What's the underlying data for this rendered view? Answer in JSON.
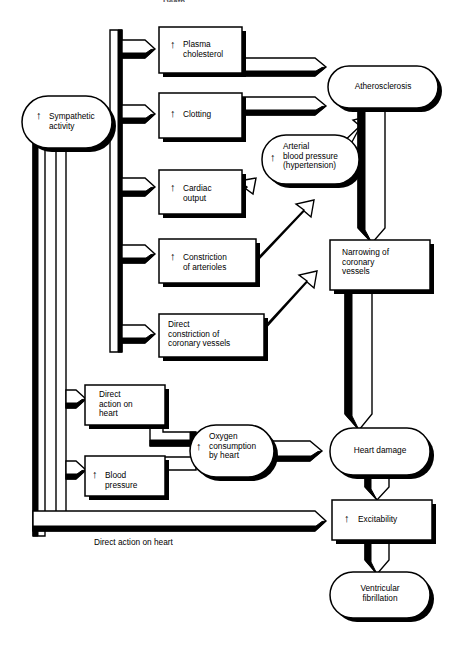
{
  "figure": {
    "title_fragment": "Death",
    "bottom_caption": "Direct action on heart",
    "background_color": "#ffffff",
    "line_color": "#000000"
  },
  "nodes": {
    "sympathetic_activity": {
      "label": "Sympathetic\nactivity",
      "shape": "rounded-oval",
      "has_up_arrow": true
    },
    "plasma_cholesterol": {
      "label": "Plasma\ncholesterol",
      "shape": "rectangle",
      "has_up_arrow": true
    },
    "clotting": {
      "label": "Clotting",
      "shape": "rectangle",
      "has_up_arrow": true
    },
    "cardiac_output": {
      "label": "Cardiac\noutput",
      "shape": "rectangle",
      "has_up_arrow": true
    },
    "constriction_arterioles": {
      "label": "Constriction\nof arterioles",
      "shape": "rectangle",
      "has_up_arrow": true
    },
    "direct_constriction_coronary": {
      "label": "Direct\nconstriction of\ncoronary vessels",
      "shape": "rectangle",
      "has_up_arrow": false
    },
    "arterial_blood_pressure": {
      "label": "Arterial\nblood pressure\n(hypertension)",
      "shape": "rounded-oval",
      "has_up_arrow": true
    },
    "atherosclerosis": {
      "label": "Atherosclerosis",
      "shape": "rounded-oval",
      "has_up_arrow": false
    },
    "narrowing_coronary_vessels": {
      "label": "Narrowing of\ncoronary\nvessels",
      "shape": "rectangle",
      "has_up_arrow": false
    },
    "direct_action_on_heart": {
      "label": "Direct\naction on\nheart",
      "shape": "rectangle",
      "has_up_arrow": false
    },
    "blood_pressure": {
      "label": "Blood\npressure",
      "shape": "rectangle",
      "has_up_arrow": true
    },
    "oxygen_consumption": {
      "label": "Oxygen\nconsumption\nby heart",
      "shape": "rounded-oval",
      "has_up_arrow": true
    },
    "heart_damage": {
      "label": "Heart damage",
      "shape": "rounded-oval",
      "has_up_arrow": false
    },
    "excitability": {
      "label": "Excitability",
      "shape": "rectangle",
      "has_up_arrow": true
    },
    "ventricular_fibrillation": {
      "label": "Ventricular\nfibrillation",
      "shape": "rounded-oval",
      "has_up_arrow": false
    }
  },
  "edges": [
    {
      "from": "sympathetic_activity",
      "to": "plasma_cholesterol"
    },
    {
      "from": "sympathetic_activity",
      "to": "clotting"
    },
    {
      "from": "sympathetic_activity",
      "to": "cardiac_output"
    },
    {
      "from": "sympathetic_activity",
      "to": "constriction_arterioles"
    },
    {
      "from": "sympathetic_activity",
      "to": "direct_constriction_coronary"
    },
    {
      "from": "sympathetic_activity",
      "to": "direct_action_on_heart"
    },
    {
      "from": "sympathetic_activity",
      "to": "blood_pressure"
    },
    {
      "from": "sympathetic_activity",
      "to": "excitability",
      "label": "Direct action on heart"
    },
    {
      "from": "plasma_cholesterol",
      "to": "atherosclerosis"
    },
    {
      "from": "clotting",
      "to": "atherosclerosis"
    },
    {
      "from": "cardiac_output",
      "to": "arterial_blood_pressure"
    },
    {
      "from": "constriction_arterioles",
      "to": "arterial_blood_pressure"
    },
    {
      "from": "direct_constriction_coronary",
      "to": "narrowing_coronary_vessels"
    },
    {
      "from": "arterial_blood_pressure",
      "to": "atherosclerosis"
    },
    {
      "from": "arterial_blood_pressure",
      "to": "oxygen_consumption"
    },
    {
      "from": "atherosclerosis",
      "to": "narrowing_coronary_vessels"
    },
    {
      "from": "narrowing_coronary_vessels",
      "to": "heart_damage"
    },
    {
      "from": "direct_action_on_heart",
      "to": "oxygen_consumption"
    },
    {
      "from": "blood_pressure",
      "to": "oxygen_consumption"
    },
    {
      "from": "oxygen_consumption",
      "to": "heart_damage"
    },
    {
      "from": "heart_damage",
      "to": "excitability"
    },
    {
      "from": "excitability",
      "to": "ventricular_fibrillation"
    }
  ]
}
